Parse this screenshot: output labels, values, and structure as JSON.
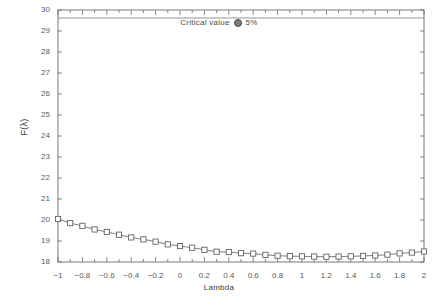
{
  "chart_data": {
    "type": "line",
    "title": "",
    "xlabel": "Lambda",
    "ylabel": "F(λ)",
    "xlim": [
      -1,
      2
    ],
    "ylim": [
      18,
      30
    ],
    "grid": false,
    "legend_position": "top-center",
    "legend_text": "Critical value",
    "legend_marker_label": "5%",
    "annotations": [
      {
        "name": "critical-value-line",
        "type": "hline",
        "y": 29.62,
        "label": "Critical value @ 5%"
      }
    ],
    "yticks": [
      18,
      19,
      20,
      21,
      22,
      23,
      24,
      25,
      26,
      27,
      28,
      29,
      30
    ],
    "ytick_labels": [
      "18",
      "19",
      "20",
      "21",
      "22",
      "23",
      "24",
      "25",
      "26",
      "27",
      "28",
      "29",
      "30"
    ],
    "xticks": [
      -1,
      -0.8,
      -0.6,
      -0.4,
      -0.2,
      0,
      0.2,
      0.4,
      0.6,
      0.8,
      1,
      1.2,
      1.4,
      1.6,
      1.8,
      2
    ],
    "xtick_labels": [
      "−1",
      "−0.8",
      "−0.6",
      "−0.4",
      "−0.2",
      "0",
      "0.2",
      "0.4",
      "0.6",
      "0.8",
      "1",
      "1.2",
      "1.4",
      "1.6",
      "1.8",
      "2"
    ],
    "series": [
      {
        "name": "F(lambda)",
        "marker": "open-square",
        "color": "#6e6e6e",
        "x": [
          -1,
          -0.9,
          -0.8,
          -0.7,
          -0.6,
          -0.5,
          -0.4,
          -0.3,
          -0.2,
          -0.1,
          0,
          0.1,
          0.2,
          0.3,
          0.4,
          0.5,
          0.6,
          0.7,
          0.8,
          0.9,
          1,
          1.1,
          1.2,
          1.3,
          1.4,
          1.5,
          1.6,
          1.7,
          1.8,
          1.9,
          2
        ],
        "values": [
          20.05,
          19.85,
          19.72,
          19.55,
          19.43,
          19.3,
          19.17,
          19.08,
          18.97,
          18.84,
          18.76,
          18.68,
          18.58,
          18.49,
          18.47,
          18.42,
          18.4,
          18.34,
          18.3,
          18.28,
          18.27,
          18.26,
          18.25,
          18.26,
          18.27,
          18.29,
          18.31,
          18.35,
          18.41,
          18.45,
          18.5
        ]
      }
    ]
  },
  "colors": {
    "axis": "#6a6a6a",
    "line": "#6e6e6e",
    "marker_stroke": "#5a5a5a",
    "critical_line": "#8a8a8a",
    "text": "#4a4a4a",
    "background": "#ffffff"
  }
}
